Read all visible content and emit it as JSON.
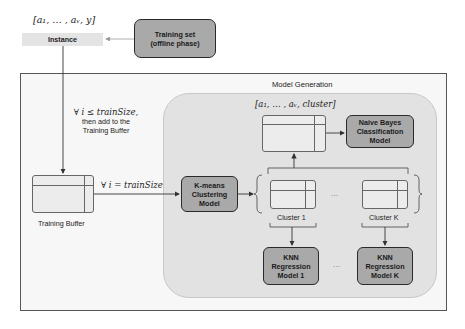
{
  "top": {
    "instance_vector": "[a₁, … , aᵥ, y]",
    "instance_label": "Instance",
    "training_set_line1": "Training set",
    "training_set_line2": "(offline phase)"
  },
  "model_generation": {
    "title": "Model Generation",
    "condition_le_line1": "∀ i ≤ trainSize,",
    "condition_le_line2": "then add to the",
    "condition_le_line3": "Training Buffer",
    "condition_eq": "∀ i = trainSize",
    "training_buffer_label": "Training Buffer",
    "kmeans_line1": "K-means",
    "kmeans_line2": "Clustering",
    "kmeans_line3": "Model",
    "cluster_vector": "[a₁, … , aᵥ, cluster]",
    "nb_line1": "Naive Bayes",
    "nb_line2": "Classification",
    "nb_line3": "Model",
    "cluster_1_label": "Cluster 1",
    "cluster_k_label": "Cluster K",
    "ellipsis": "···",
    "knn1_line1": "KNN",
    "knn1_line2": "Regression",
    "knn1_line3": "Model 1",
    "knnk_line1": "KNN",
    "knnk_line2": "Regression",
    "knnk_line3": "Model K"
  },
  "colors": {
    "model_box_fill": "#a9a9a9",
    "model_box_border": "#2a2a2a",
    "inner_region": "#e2e2e2",
    "outer_region": "#f7f7f7",
    "instance_bar": "#e4e4e4"
  }
}
